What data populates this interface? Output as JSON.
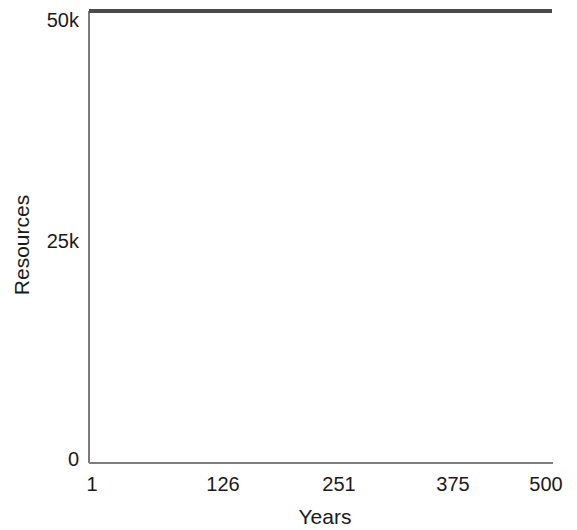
{
  "chart_data": {
    "type": "line",
    "title": "",
    "subtitle": "",
    "xlabel": "Years",
    "ylabel": "Resources",
    "x": [
      1,
      126,
      251,
      375,
      500
    ],
    "xlim": [
      1,
      500
    ],
    "ylim": [
      0,
      51000
    ],
    "xticks": [
      1,
      126,
      251,
      375,
      500
    ],
    "xticklabels": [
      "1",
      "126",
      "251",
      "375",
      "500"
    ],
    "yticks": [
      0,
      25000,
      50000
    ],
    "yticklabels": [
      "0",
      "25k",
      "50k"
    ],
    "grid": false,
    "legend": null,
    "legend_position": "none",
    "annotations": [],
    "series": [
      {
        "name": "Resources",
        "color": "#4a4a4a",
        "line_width": 4,
        "x": [
          1,
          126,
          251,
          375,
          500
        ],
        "values": [
          51000,
          51000,
          51000,
          51000,
          51000
        ]
      }
    ]
  },
  "axes": {
    "x_label": "Years",
    "y_label": "Resources",
    "x_tick_labels": [
      "1",
      "126",
      "251",
      "375",
      "500"
    ],
    "y_tick_labels": [
      "0",
      "25k",
      "50k"
    ],
    "axis_color": "#7d7d7d"
  },
  "colors": {
    "background": "#ffffff",
    "series": "#4a4a4a",
    "axis": "#7d7d7d",
    "text": "#1a1a1a"
  }
}
